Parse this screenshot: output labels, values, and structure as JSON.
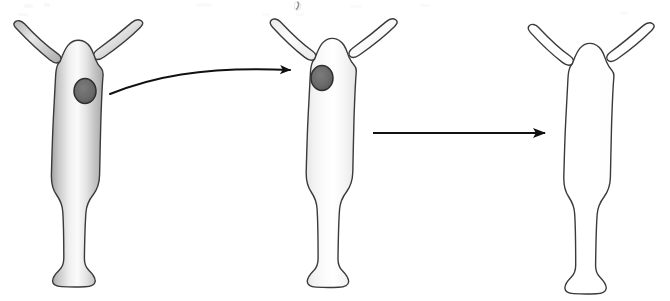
{
  "figure": {
    "caption": "",
    "background_color": "#ffffff",
    "width": 670,
    "height": 301
  },
  "style": {
    "outline_color": "#3a3a3a",
    "outline_width": 1.4,
    "arrow_color": "#111111",
    "spot_fill": "#6a6a6a",
    "spot_stroke": "#2e2e2e",
    "body_shaded_light": "#ffffff",
    "body_shaded_mid": "#d8d8d8",
    "body_shaded_dark": "#a9a9a9",
    "body_pale_light": "#ffffff",
    "body_pale_mid": "#f3f3f3",
    "body_pale_dark": "#e2e2e2",
    "body_plain": "#ffffff"
  },
  "organisms": [
    {
      "id": "organism-1",
      "label": "Hydra with dark graft spot, heavily shaded body",
      "shading": "shaded",
      "has_spot": true,
      "spot": {
        "cx": 85,
        "cy": 91,
        "rx": 11,
        "ry": 12.5
      },
      "center_x": 78,
      "tentacle_count": 2
    },
    {
      "id": "organism-2",
      "label": "Hydra with dark graft spot, pale body",
      "shading": "pale",
      "has_spot": true,
      "spot": {
        "cx": 322,
        "cy": 78,
        "rx": 11,
        "ry": 12.5
      },
      "center_x": 332,
      "tentacle_count": 2
    },
    {
      "id": "organism-3",
      "label": "Hydra outline only, no graft spot",
      "shading": "plain",
      "has_spot": false,
      "spot": null,
      "center_x": 592,
      "tentacle_count": 2
    }
  ],
  "arrows": [
    {
      "id": "arrow-1",
      "label": "Curved transfer arrow from organism 1 to organism 2",
      "shape": "curved",
      "from": {
        "x": 110,
        "y": 94
      },
      "to": {
        "x": 300,
        "y": 70
      },
      "control": {
        "x": 200,
        "y": 66
      }
    },
    {
      "id": "arrow-2",
      "label": "Straight transition arrow from organism 2 to organism 3",
      "shape": "straight",
      "from": {
        "x": 373,
        "y": 133
      },
      "to": {
        "x": 556,
        "y": 133
      }
    }
  ]
}
